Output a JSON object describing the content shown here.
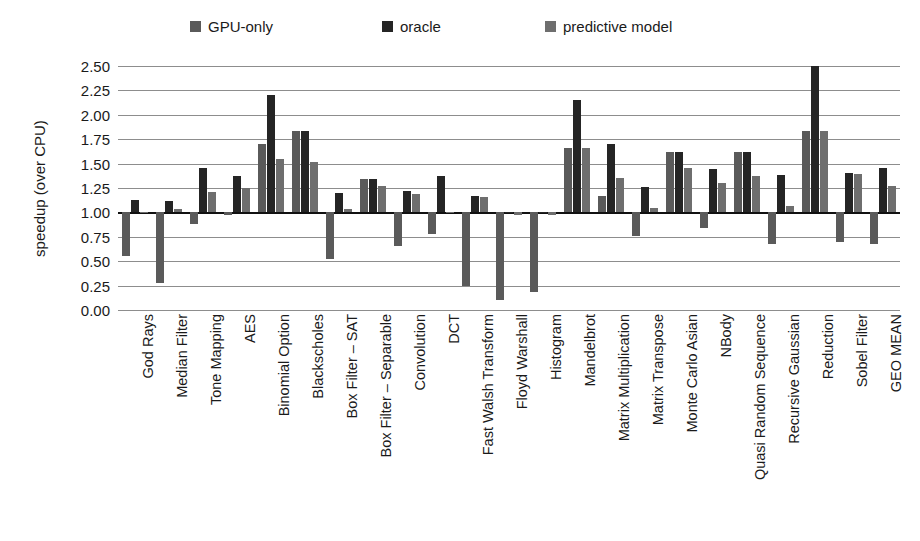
{
  "legend": {
    "items": [
      {
        "label": "GPU-only",
        "color": "#5a5a5a",
        "x": 190
      },
      {
        "label": "oracle",
        "color": "#252525",
        "x": 382
      },
      {
        "label": "predictive model",
        "color": "#6e6e6e",
        "x": 545
      }
    ]
  },
  "axes": {
    "ylabel": "speedup (over CPU)",
    "yticks": [
      "2.50",
      "2.25",
      "2.00",
      "1.75",
      "1.50",
      "1.25",
      "1.00",
      "0.75",
      "0.50",
      "0.25",
      "0.00"
    ]
  },
  "chart_data": {
    "type": "bar",
    "title": "",
    "xlabel": "",
    "ylabel": "speedup (over CPU)",
    "ylim": [
      0.0,
      2.5
    ],
    "ytick_step": 0.25,
    "grid": true,
    "baseline": 1.0,
    "legend_position": "top",
    "categories": [
      "God Rays",
      "Median Filter",
      "Tone Mapping",
      "AES",
      "Binomial Option",
      "Blackscholes",
      "Box Filter – SAT",
      "Box Filter – Separable",
      "Convolution",
      "DCT",
      "Fast Walsh Transform",
      "Floyd Warshall",
      "Histogram",
      "Mandelbrot",
      "Matrix Multiplication",
      "Matrix Transpose",
      "Monte Carlo Asian",
      "NBody",
      "Quasi Random Sequence",
      "Recursive Gaussian",
      "Reduction",
      "Sobel Filter",
      "GEO MEAN"
    ],
    "series": [
      {
        "name": "GPU-only",
        "color": "#5a5a5a",
        "values": [
          0.55,
          0.28,
          0.88,
          0.97,
          1.7,
          1.83,
          0.52,
          1.34,
          0.66,
          0.78,
          0.25,
          0.1,
          0.18,
          1.66,
          1.17,
          0.76,
          1.62,
          0.84,
          1.62,
          0.68,
          1.83,
          0.7,
          0.68
        ]
      },
      {
        "name": "oracle",
        "color": "#252525",
        "values": [
          1.13,
          1.12,
          1.45,
          1.37,
          2.2,
          1.83,
          1.2,
          1.34,
          1.22,
          1.37,
          1.17,
          1.0,
          1.0,
          2.15,
          1.7,
          1.26,
          1.62,
          1.44,
          1.62,
          1.38,
          2.5,
          1.4,
          1.45
        ]
      },
      {
        "name": "predictive model",
        "color": "#6e6e6e",
        "values": [
          1.0,
          1.03,
          1.21,
          1.25,
          1.55,
          1.52,
          1.03,
          1.27,
          1.19,
          1.0,
          1.16,
          0.97,
          0.97,
          1.66,
          1.35,
          1.05,
          1.45,
          1.3,
          1.37,
          1.07,
          1.83,
          1.39,
          1.27
        ]
      }
    ]
  }
}
